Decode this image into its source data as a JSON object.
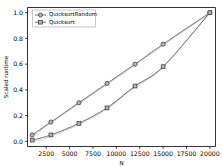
{
  "chart_data": {
    "type": "line",
    "title": "",
    "xlabel": "N",
    "ylabel": "Scaled runtime",
    "xlim": [
      500,
      20600
    ],
    "ylim": [
      -0.04,
      1.04
    ],
    "grid": false,
    "legend_position": "upper left",
    "x_ticks": [
      2500,
      5000,
      7500,
      10000,
      12500,
      15000,
      17500,
      20000
    ],
    "x_tick_labels": [
      "2500",
      "5000",
      "7500",
      "10000",
      "12500",
      "15000",
      "17500",
      "20000"
    ],
    "y_ticks": [
      0.0,
      0.2,
      0.4,
      0.6,
      0.8,
      1.0
    ],
    "y_tick_labels": [
      "0.0",
      "0.2",
      "0.4",
      "0.6",
      "0.8",
      "1.0"
    ],
    "x": [
      1000,
      3000,
      6000,
      9000,
      12000,
      15000,
      20000
    ],
    "series": [
      {
        "name": "QuicksortRandom",
        "marker": "circle",
        "values": [
          0.05,
          0.15,
          0.3,
          0.45,
          0.6,
          0.755,
          1.0
        ]
      },
      {
        "name": "Quicksort",
        "marker": "square",
        "values": [
          0.01,
          0.05,
          0.14,
          0.26,
          0.43,
          0.58,
          1.0
        ]
      }
    ]
  },
  "legend": {
    "items": [
      {
        "label": "QuicksortRandom",
        "marker": "circle"
      },
      {
        "label": "Quicksort",
        "marker": "square"
      }
    ]
  },
  "axes": {
    "x_axis_label": "N",
    "y_axis_label": "Scaled runtime"
  }
}
